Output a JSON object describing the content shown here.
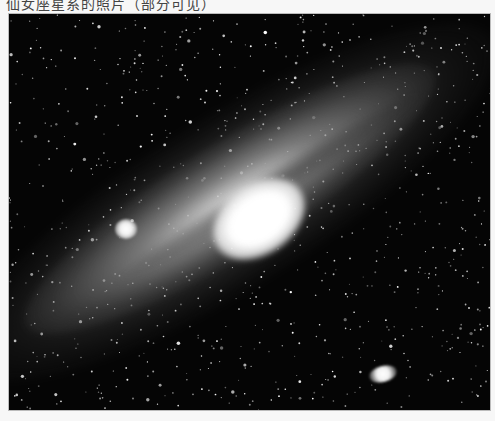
{
  "caption": {
    "text": "仙女座星系的照片（部分可见）",
    "note_visible": "top text line is cut off; only lower half of characters visible"
  },
  "photo": {
    "subject": "Andromeda Galaxy (spiral galaxy) with satellite galaxies",
    "features": [
      {
        "name": "galaxy-core",
        "description": "bright white central bulge"
      },
      {
        "name": "satellite-galaxy-upper-left",
        "description": "small bright elliptical companion left of core"
      },
      {
        "name": "satellite-galaxy-lower-right",
        "description": "fainter elongated companion near bottom right"
      }
    ],
    "colors": {
      "background": "#050505",
      "core": "#ffffff",
      "disk": "#aaaaaa",
      "page_background": "#f7f7f7"
    }
  }
}
